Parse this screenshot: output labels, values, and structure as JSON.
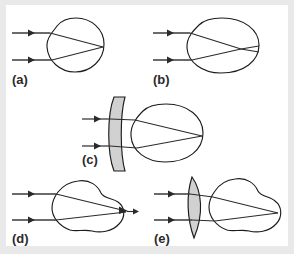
{
  "figure": {
    "background_color": "#e9e9e9",
    "plate_color": "#ffffff",
    "ray_color": "#3a3a3a",
    "outline_color": "#1c1c1c",
    "lens_fill_color": "#c9c9c9",
    "label_color": "#2b2b2b"
  },
  "panels": [
    {
      "id": "a",
      "label": "(a)",
      "condition": "emmetropia",
      "description": "Normal eye: parallel rays focus exactly on the retina",
      "has_corrective_lens": false,
      "lens_type": "none",
      "eye_shape": "round",
      "focus_location": "on retina"
    },
    {
      "id": "b",
      "label": "(b)",
      "condition": "myopia",
      "description": "Nearsighted eye: elongated eyeball, rays focus in front of the retina",
      "has_corrective_lens": false,
      "lens_type": "none",
      "eye_shape": "elongated",
      "focus_location": "in front of retina"
    },
    {
      "id": "c",
      "label": "(c)",
      "condition": "myopia corrected",
      "description": "Myopia corrected by a concave diverging lens; rays focus on the retina",
      "has_corrective_lens": true,
      "lens_type": "concave",
      "eye_shape": "elongated",
      "focus_location": "on retina"
    },
    {
      "id": "d",
      "label": "(d)",
      "condition": "hyperopia",
      "description": "Farsighted eye: shortened eyeball, rays would focus behind the retina",
      "has_corrective_lens": false,
      "lens_type": "none",
      "eye_shape": "short",
      "focus_location": "behind retina"
    },
    {
      "id": "e",
      "label": "(e)",
      "condition": "hyperopia corrected",
      "description": "Hyperopia corrected by a convex converging lens; rays focus on the retina",
      "has_corrective_lens": true,
      "lens_type": "convex",
      "eye_shape": "short",
      "focus_location": "on retina"
    }
  ]
}
